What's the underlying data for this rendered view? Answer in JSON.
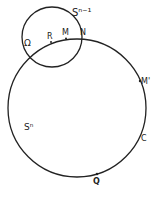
{
  "diagram": {
    "colors": {
      "stroke": "#222222",
      "background": "#ffffff"
    },
    "circles": [
      {
        "id": "big",
        "label": "Sⁿ",
        "cx": 77,
        "cy": 108,
        "r": 69
      },
      {
        "id": "small",
        "label": "Sⁿ⁻¹",
        "cx": 52,
        "cy": 37,
        "r": 30
      }
    ],
    "labels": {
      "small_sphere": "Sⁿ⁻¹",
      "big_sphere": "Sⁿ",
      "omega": "Ω",
      "r": "R",
      "m": "M",
      "n": "N",
      "m_prime": "M'",
      "c": "C",
      "q": "Q"
    }
  }
}
